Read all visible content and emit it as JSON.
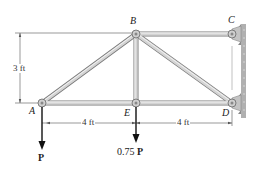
{
  "diagram": {
    "type": "truss",
    "nodes": {
      "A": {
        "label": "A",
        "x": 42,
        "y": 103
      },
      "B": {
        "label": "B",
        "x": 136,
        "y": 34
      },
      "C": {
        "label": "C",
        "x": 232,
        "y": 34
      },
      "D": {
        "label": "D",
        "x": 232,
        "y": 103
      },
      "E": {
        "label": "E",
        "x": 136,
        "y": 103
      }
    },
    "members": [
      "AB",
      "AE",
      "BE",
      "BC",
      "BD",
      "ED"
    ],
    "supports": {
      "C": "pin to wall",
      "D": "pin to wall"
    },
    "dimensions": {
      "height": "3 ft",
      "AE": "4 ft",
      "ED": "4 ft"
    },
    "loads": {
      "A": {
        "magnitude": "",
        "symbol": "P"
      },
      "E": {
        "magnitude": "0.75",
        "symbol": "P"
      }
    },
    "colors": {
      "member": "#c8c8c8",
      "member_edge": "#7a7a7a",
      "wall": "#9a9a9a",
      "arrow": "#111111"
    }
  }
}
